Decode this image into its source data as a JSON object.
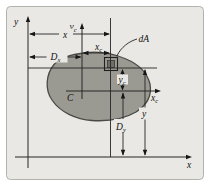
{
  "figure": {
    "colors": {
      "panel_bg": "#e9e8e4",
      "blob_fill": "#9b9a92",
      "da_fill": "#6f6e67",
      "line": "#262626"
    },
    "axes": {
      "y": {
        "label": "y"
      },
      "x": {
        "label": "x"
      },
      "yc": {
        "base": "y",
        "sub": "c"
      },
      "xc": {
        "base": "x",
        "sub": "c"
      }
    },
    "dimensions": {
      "x": {
        "label": "x"
      },
      "Dx": {
        "base": "D",
        "sub": "x"
      },
      "xc": {
        "base": "x",
        "sub": "c"
      },
      "yc": {
        "base": "y",
        "sub": "c"
      },
      "Dy": {
        "base": "D",
        "sub": "y"
      },
      "y": {
        "label": "y"
      }
    },
    "annotations": {
      "area_element": "dA",
      "centroid": "C"
    }
  }
}
